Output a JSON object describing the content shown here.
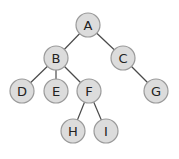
{
  "diagram": {
    "type": "binary-tree",
    "colors": {
      "node_fill": "#dcdcdc",
      "node_stroke": "#9a9a9a",
      "edge": "#4a4a4a",
      "text": "#222222"
    },
    "nodes": [
      {
        "id": "A",
        "label": "A",
        "x": 88,
        "y": 25
      },
      {
        "id": "B",
        "label": "B",
        "x": 56,
        "y": 58
      },
      {
        "id": "C",
        "label": "C",
        "x": 123,
        "y": 58
      },
      {
        "id": "D",
        "label": "D",
        "x": 22,
        "y": 91
      },
      {
        "id": "E",
        "label": "E",
        "x": 56,
        "y": 91
      },
      {
        "id": "F",
        "label": "F",
        "x": 89,
        "y": 91
      },
      {
        "id": "G",
        "label": "G",
        "x": 156,
        "y": 91
      },
      {
        "id": "H",
        "label": "H",
        "x": 73,
        "y": 131
      },
      {
        "id": "I",
        "label": "I",
        "x": 106,
        "y": 131
      }
    ],
    "edges": [
      {
        "from": "A",
        "to": "B"
      },
      {
        "from": "A",
        "to": "C"
      },
      {
        "from": "B",
        "to": "D"
      },
      {
        "from": "B",
        "to": "E"
      },
      {
        "from": "B",
        "to": "F"
      },
      {
        "from": "C",
        "to": "G"
      },
      {
        "from": "F",
        "to": "H"
      },
      {
        "from": "F",
        "to": "I"
      }
    ]
  }
}
